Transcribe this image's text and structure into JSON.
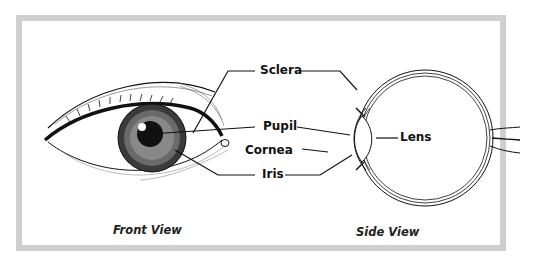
{
  "diagram": {
    "labels": {
      "sclera": "Sclera",
      "pupil": "Pupil",
      "cornea": "Cornea",
      "iris": "Iris",
      "lens": "Lens"
    },
    "captions": {
      "front": "Front View",
      "side": "Side View"
    },
    "colors": {
      "frame": "#cfcfcf",
      "ink": "#111111",
      "background": "#ffffff"
    }
  }
}
